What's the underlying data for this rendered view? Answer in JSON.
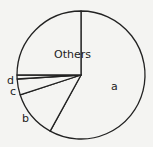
{
  "chart_data": {
    "type": "pie",
    "title": "",
    "categories": [
      "a",
      "b",
      "c",
      "d",
      "Others"
    ],
    "values": [
      58,
      12,
      4,
      1,
      25
    ],
    "start_angle_deg": 0,
    "direction": "clockwise",
    "colors": {
      "fill": "#f4f4f2",
      "stroke": "#222222"
    },
    "legend": "none",
    "labels": [
      {
        "text": "a",
        "x": 111,
        "y": 90
      },
      {
        "text": "b",
        "x": 22,
        "y": 122
      },
      {
        "text": "c",
        "x": 10,
        "y": 95
      },
      {
        "text": "d",
        "x": 7,
        "y": 84
      },
      {
        "text": "Others",
        "x": 54,
        "y": 58
      }
    ]
  },
  "geometry": {
    "cx": 81,
    "cy": 75,
    "r": 64
  }
}
